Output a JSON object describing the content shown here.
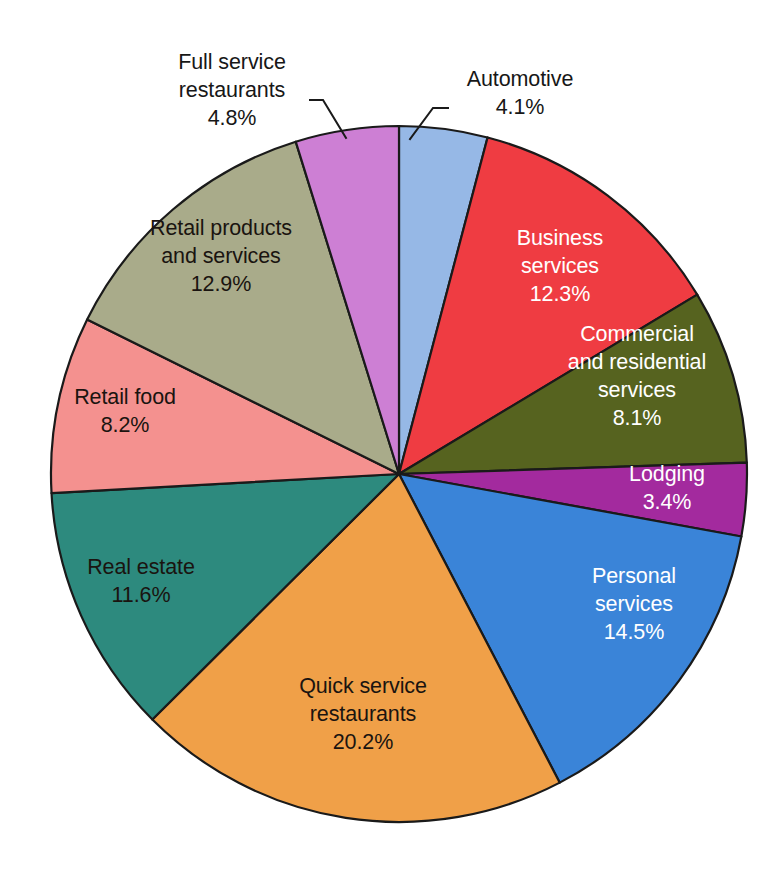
{
  "chart_data": {
    "type": "pie",
    "title": "",
    "subtitle": "",
    "xlabel": "",
    "ylabel": "",
    "legend_position": "none",
    "grid": false,
    "units": "percent",
    "start_angle_deg": 0,
    "direction": "clockwise",
    "center": {
      "x": 399,
      "y": 474
    },
    "radius": 348,
    "categories": [
      "Automotive",
      "Business services",
      "Commercial and residential services",
      "Lodging",
      "Personal services",
      "Quick service restaurants",
      "Real estate",
      "Retail food",
      "Retail products and services",
      "Full service restaurants"
    ],
    "values": [
      4.1,
      12.3,
      8.1,
      3.4,
      14.5,
      20.2,
      11.6,
      8.2,
      12.9,
      4.8
    ],
    "colors": [
      "#96b8e6",
      "#ef3c42",
      "#56631f",
      "#a32a9e",
      "#3a84d8",
      "#f0a048",
      "#2d8a7e",
      "#f4918f",
      "#a9ab8a",
      "#cd7fd4"
    ],
    "slices": [
      {
        "name": "automotive",
        "label_lines": [
          "Automotive"
        ],
        "value_label": "4.1%",
        "percent": 4.1,
        "color": "#96b8e6",
        "label_placement": "outside",
        "label_color": "dark",
        "label_x": 520,
        "label_y": 86,
        "leader": "M 410 139 L 433 108 L 448 108"
      },
      {
        "name": "business-services",
        "label_lines": [
          "Business",
          "services"
        ],
        "value_label": "12.3%",
        "percent": 12.3,
        "color": "#ef3c42",
        "label_placement": "inside",
        "label_color": "light",
        "label_x": 560,
        "label_y": 267
      },
      {
        "name": "commercial-and-residential-services",
        "label_lines": [
          "Commercial",
          "and residential",
          "services"
        ],
        "value_label": "8.1%",
        "percent": 8.1,
        "color": "#56631f",
        "label_placement": "inside",
        "label_color": "light",
        "label_x": 637,
        "label_y": 377
      },
      {
        "name": "lodging",
        "label_lines": [
          "Lodging"
        ],
        "value_label": "3.4%",
        "percent": 3.4,
        "color": "#a32a9e",
        "label_placement": "inside",
        "label_color": "light",
        "label_x": 667,
        "label_y": 489
      },
      {
        "name": "personal-services",
        "label_lines": [
          "Personal",
          "services"
        ],
        "value_label": "14.5%",
        "percent": 14.5,
        "color": "#3a84d8",
        "label_placement": "inside",
        "label_color": "light",
        "label_x": 634,
        "label_y": 605
      },
      {
        "name": "quick-service-restaurants",
        "label_lines": [
          "Quick service",
          "restaurants"
        ],
        "value_label": "20.2%",
        "percent": 20.2,
        "color": "#f0a048",
        "label_placement": "inside",
        "label_color": "dark",
        "label_x": 363,
        "label_y": 715
      },
      {
        "name": "real-estate",
        "label_lines": [
          "Real estate"
        ],
        "value_label": "11.6%",
        "percent": 11.6,
        "color": "#2d8a7e",
        "label_placement": "inside",
        "label_color": "dark",
        "label_x": 141,
        "label_y": 582
      },
      {
        "name": "retail-food",
        "label_lines": [
          "Retail food"
        ],
        "value_label": "8.2%",
        "percent": 8.2,
        "color": "#f4918f",
        "label_placement": "inside",
        "label_color": "dark",
        "label_x": 125,
        "label_y": 412
      },
      {
        "name": "retail-products-and-services",
        "label_lines": [
          "Retail products",
          "and services"
        ],
        "value_label": "12.9%",
        "percent": 12.9,
        "color": "#a9ab8a",
        "label_placement": "inside",
        "label_color": "dark",
        "label_x": 221,
        "label_y": 257
      },
      {
        "name": "full-service-restaurants",
        "label_lines": [
          "Full service",
          "restaurants"
        ],
        "value_label": "4.8%",
        "percent": 4.8,
        "color": "#cd7fd4",
        "label_placement": "outside",
        "label_color": "dark",
        "label_x": 232,
        "label_y": 69,
        "leader": "M 346 138 L 323 100 L 310 100"
      }
    ]
  }
}
